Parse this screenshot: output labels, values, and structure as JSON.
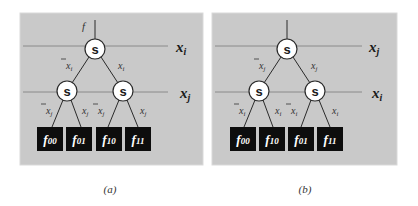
{
  "panels": [
    {
      "id": "a",
      "caption": "(a)",
      "root_output_label": "f",
      "levels": [
        {
          "variable": "x",
          "sub": "i"
        },
        {
          "variable": "x",
          "sub": "j"
        }
      ],
      "node_label": "s",
      "root_edges": [
        {
          "label": "x",
          "sub": "i",
          "negated": true
        },
        {
          "label": "x",
          "sub": "i",
          "negated": false
        }
      ],
      "leaf_edges": [
        {
          "label": "x",
          "sub": "j",
          "negated": true
        },
        {
          "label": "x",
          "sub": "j",
          "negated": false
        },
        {
          "label": "x",
          "sub": "j",
          "negated": true
        },
        {
          "label": "x",
          "sub": "j",
          "negated": false
        }
      ],
      "leaves": [
        {
          "label": "f",
          "sub": "00"
        },
        {
          "label": "f",
          "sub": "01"
        },
        {
          "label": "f",
          "sub": "10"
        },
        {
          "label": "f",
          "sub": "11"
        }
      ]
    },
    {
      "id": "b",
      "caption": "(b)",
      "root_output_label": "",
      "levels": [
        {
          "variable": "x",
          "sub": "j"
        },
        {
          "variable": "x",
          "sub": "i"
        }
      ],
      "node_label": "s",
      "root_edges": [
        {
          "label": "x",
          "sub": "j",
          "negated": true
        },
        {
          "label": "x",
          "sub": "j",
          "negated": false
        }
      ],
      "leaf_edges": [
        {
          "label": "x",
          "sub": "i",
          "negated": true
        },
        {
          "label": "x",
          "sub": "i",
          "negated": false
        },
        {
          "label": "x",
          "sub": "i",
          "negated": true
        },
        {
          "label": "x",
          "sub": "i",
          "negated": false
        }
      ],
      "leaves": [
        {
          "label": "f",
          "sub": "00"
        },
        {
          "label": "f",
          "sub": "10"
        },
        {
          "label": "f",
          "sub": "01"
        },
        {
          "label": "f",
          "sub": "11"
        }
      ]
    }
  ],
  "colors": {
    "panel_background": "#c9c9c9",
    "leaf_fill": "#0d0d0d",
    "node_fill": "#ffffff"
  }
}
